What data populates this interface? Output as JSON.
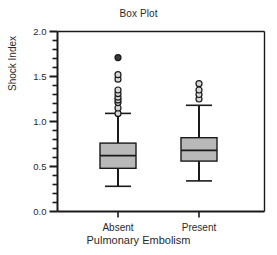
{
  "chart_data": {
    "type": "box",
    "title": "Box Plot",
    "xlabel": "Pulmonary Embolism",
    "ylabel": "Shock Index",
    "categories": [
      "Absent",
      "Present"
    ],
    "ylim": [
      0.0,
      2.0
    ],
    "ytick_labels": [
      "0.0",
      "0.5",
      "1.0",
      "1.5",
      "2.0"
    ],
    "ytick_values": [
      0.0,
      0.5,
      1.0,
      1.5,
      2.0
    ],
    "yminor_step": 0.1,
    "grid": false,
    "legend": null,
    "box_fill_color": "#b9b9b9",
    "box_line_color": "#1a1a1a",
    "series": [
      {
        "name": "Absent",
        "whisker_low": 0.28,
        "q1": 0.48,
        "median": 0.62,
        "q3": 0.76,
        "whisker_high": 1.09,
        "outliers": [
          1.09,
          1.15,
          1.21,
          1.24,
          1.27,
          1.31,
          1.35,
          1.47,
          1.52,
          1.71
        ]
      },
      {
        "name": "Present",
        "whisker_low": 0.34,
        "q1": 0.56,
        "median": 0.68,
        "q3": 0.82,
        "whisker_high": 1.18,
        "outliers": [
          1.25,
          1.3,
          1.35,
          1.42
        ]
      }
    ]
  }
}
